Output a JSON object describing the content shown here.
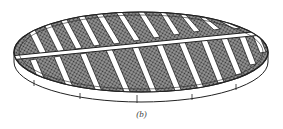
{
  "figure": {
    "caption": "(b)",
    "colors": {
      "line": "#222222",
      "mesh_fill": "#6a6a6a",
      "background": "#ffffff"
    },
    "beam_count_upper": 11,
    "beam_count_lower": 11
  }
}
